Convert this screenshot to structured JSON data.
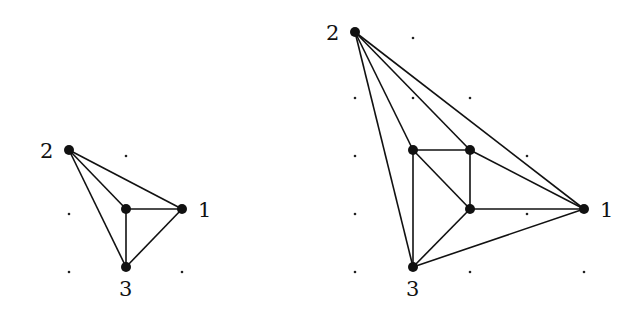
{
  "figure": {
    "left_graph": {
      "vertices": [
        {
          "id": "v2",
          "label": "2",
          "x": 69,
          "y": 150,
          "lx": 40,
          "ly": 158
        },
        {
          "id": "c",
          "label": "",
          "x": 126,
          "y": 209
        },
        {
          "id": "v1",
          "label": "1",
          "x": 182,
          "y": 209,
          "lx": 198,
          "ly": 217
        },
        {
          "id": "v3",
          "label": "3",
          "x": 126,
          "y": 267,
          "lx": 119,
          "ly": 296
        }
      ],
      "edges": [
        [
          "v2",
          "c"
        ],
        [
          "v2",
          "v1"
        ],
        [
          "v2",
          "v3"
        ],
        [
          "c",
          "v1"
        ],
        [
          "c",
          "v3"
        ],
        [
          "v1",
          "v3"
        ]
      ],
      "grid_dots": [
        [
          126,
          156
        ],
        [
          69,
          214
        ],
        [
          69,
          272
        ],
        [
          182,
          272
        ]
      ]
    },
    "right_graph": {
      "vertices": [
        {
          "id": "v2",
          "label": "2",
          "x": 355,
          "y": 32,
          "lx": 326,
          "ly": 40
        },
        {
          "id": "a",
          "label": "",
          "x": 413,
          "y": 150
        },
        {
          "id": "b",
          "label": "",
          "x": 470,
          "y": 150
        },
        {
          "id": "c",
          "label": "",
          "x": 470,
          "y": 209
        },
        {
          "id": "v1",
          "label": "1",
          "x": 584,
          "y": 209,
          "lx": 600,
          "ly": 217
        },
        {
          "id": "v3",
          "label": "3",
          "x": 413,
          "y": 267,
          "lx": 406,
          "ly": 296
        }
      ],
      "edges": [
        [
          "v2",
          "a"
        ],
        [
          "v2",
          "v3"
        ],
        [
          "v2",
          "b"
        ],
        [
          "v2",
          "v1"
        ],
        [
          "a",
          "b"
        ],
        [
          "a",
          "c"
        ],
        [
          "a",
          "v3"
        ],
        [
          "b",
          "c"
        ],
        [
          "b",
          "v1"
        ],
        [
          "c",
          "v1"
        ],
        [
          "c",
          "v3"
        ],
        [
          "v3",
          "v1"
        ]
      ],
      "grid_dots": [
        [
          413,
          38
        ],
        [
          355,
          98
        ],
        [
          413,
          98
        ],
        [
          470,
          98
        ],
        [
          355,
          156
        ],
        [
          527,
          156
        ],
        [
          355,
          214
        ],
        [
          527,
          214
        ],
        [
          355,
          272
        ],
        [
          470,
          272
        ],
        [
          584,
          272
        ]
      ]
    },
    "labels": {
      "left_1": "1",
      "left_2": "2",
      "left_3": "3",
      "right_1": "1",
      "right_2": "2",
      "right_3": "3"
    }
  }
}
